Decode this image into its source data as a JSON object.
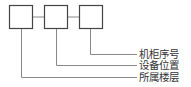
{
  "diagram": {
    "type": "code-format-legend",
    "line_color": "#555555",
    "lead_color": "#777777",
    "boxes": [
      {
        "id": "box-1",
        "x": 9,
        "y": 5,
        "w": 23,
        "h": 23
      },
      {
        "id": "box-2",
        "x": 44,
        "y": 5,
        "w": 23,
        "h": 23
      },
      {
        "id": "box-3",
        "x": 79,
        "y": 5,
        "w": 23,
        "h": 23
      }
    ],
    "labels": [
      {
        "text": "机柜序号",
        "box": "box-3",
        "y": 54
      },
      {
        "text": "设备位置",
        "box": "box-2",
        "y": 65
      },
      {
        "text": "所属楼层",
        "box": "box-1",
        "y": 77
      }
    ]
  }
}
